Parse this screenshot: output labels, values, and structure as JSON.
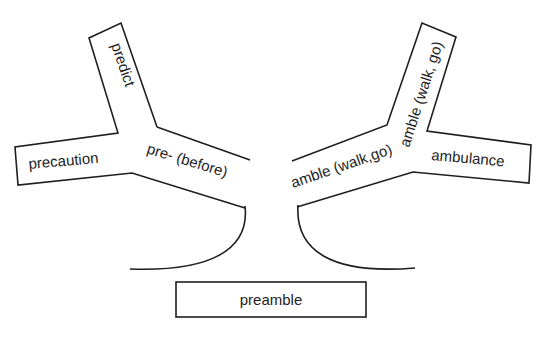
{
  "diagram": {
    "type": "word-tree",
    "root": {
      "label": "preamble"
    },
    "left_branch": {
      "trunk_label": "pre- (before)",
      "words": [
        {
          "label": "predict",
          "direction": "up"
        },
        {
          "label": "precaution",
          "direction": "left"
        }
      ]
    },
    "right_branch": {
      "trunk_label": "amble (walk,go)",
      "words": [
        {
          "label": "amble (walk, go)",
          "direction": "up"
        },
        {
          "label": "ambulance",
          "direction": "right"
        }
      ]
    },
    "colors": {
      "background": "#ffffff",
      "stroke": "#1e1e1e",
      "text": "#1e1e1e"
    }
  }
}
